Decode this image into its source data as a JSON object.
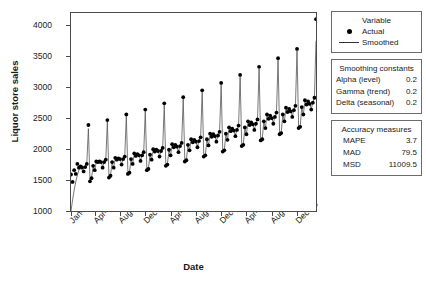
{
  "chart_data": {
    "type": "line",
    "title": "",
    "xlabel": "Date",
    "ylabel": "Liquor store sales",
    "ylim": [
      1000,
      4200
    ],
    "yticks": [
      1000,
      1500,
      2000,
      2500,
      3000,
      3500,
      4000
    ],
    "grid": false,
    "x_tick_labels": [
      "Jan-92",
      "Apr-93",
      "Aug-94",
      "Dec-95",
      "Apr-97",
      "Aug-98",
      "Dec-99",
      "Apr-01",
      "Aug-02",
      "Dec-03"
    ],
    "x_tick_indices": [
      0,
      15,
      31,
      47,
      63,
      79,
      95,
      111,
      127,
      143
    ],
    "x_start": "Jan-92",
    "x_end": "Dec-04",
    "n_points": 156,
    "legend_position": "right",
    "series": [
      {
        "name": "Actual",
        "style": "points",
        "marker": "filled-circle",
        "color": "#000000",
        "values": [
          1590,
          1470,
          1660,
          1600,
          1760,
          1700,
          1720,
          1700,
          1640,
          1710,
          1760,
          2390,
          1480,
          1530,
          1730,
          1660,
          1800,
          1790,
          1800,
          1790,
          1700,
          1790,
          1830,
          2470,
          1540,
          1570,
          1790,
          1700,
          1860,
          1830,
          1850,
          1840,
          1750,
          1840,
          1880,
          2560,
          1600,
          1620,
          1840,
          1760,
          1930,
          1890,
          1920,
          1900,
          1810,
          1900,
          1950,
          2640,
          1660,
          1680,
          1910,
          1830,
          2000,
          1960,
          1990,
          1970,
          1880,
          1970,
          2020,
          2740,
          1730,
          1750,
          1990,
          1900,
          2080,
          2030,
          2070,
          2040,
          1950,
          2050,
          2100,
          2840,
          1800,
          1820,
          2070,
          1980,
          2160,
          2110,
          2150,
          2120,
          2030,
          2130,
          2190,
          2950,
          1880,
          1900,
          2160,
          2060,
          2250,
          2200,
          2240,
          2210,
          2120,
          2220,
          2280,
          3070,
          1960,
          1980,
          2250,
          2150,
          2350,
          2290,
          2330,
          2300,
          2210,
          2310,
          2380,
          3200,
          2050,
          2070,
          2350,
          2240,
          2450,
          2390,
          2430,
          2400,
          2310,
          2410,
          2480,
          3330,
          2140,
          2160,
          2450,
          2340,
          2560,
          2490,
          2540,
          2500,
          2410,
          2520,
          2590,
          3470,
          2240,
          2260,
          2560,
          2450,
          2670,
          2600,
          2650,
          2610,
          2520,
          2630,
          2700,
          3620,
          2340,
          2360,
          2680,
          2560,
          2790,
          2720,
          2770,
          2730,
          2640,
          2750,
          2830,
          4100
        ]
      },
      {
        "name": "Smoothed",
        "style": "line",
        "color": "#555555",
        "values": [
          1000,
          1180,
          1340,
          1470,
          1580,
          1660,
          1720,
          1740,
          1700,
          1730,
          1770,
          2330,
          1500,
          1540,
          1720,
          1660,
          1790,
          1780,
          1800,
          1790,
          1710,
          1790,
          1830,
          2440,
          1550,
          1580,
          1780,
          1700,
          1850,
          1830,
          1850,
          1840,
          1760,
          1840,
          1880,
          2530,
          1610,
          1630,
          1830,
          1760,
          1920,
          1890,
          1910,
          1900,
          1820,
          1900,
          1950,
          2610,
          1670,
          1690,
          1900,
          1830,
          1990,
          1960,
          1980,
          1970,
          1890,
          1970,
          2020,
          2710,
          1740,
          1760,
          1980,
          1900,
          2070,
          2030,
          2060,
          2040,
          1960,
          2050,
          2100,
          2810,
          1810,
          1830,
          2060,
          1980,
          2150,
          2110,
          2140,
          2120,
          2040,
          2130,
          2190,
          2920,
          1890,
          1910,
          2150,
          2060,
          2240,
          2200,
          2230,
          2210,
          2130,
          2220,
          2280,
          3040,
          1970,
          1990,
          2240,
          2150,
          2340,
          2290,
          2320,
          2300,
          2220,
          2310,
          2380,
          3170,
          2060,
          2080,
          2340,
          2240,
          2440,
          2390,
          2420,
          2400,
          2320,
          2410,
          2480,
          3300,
          2150,
          2170,
          2440,
          2340,
          2550,
          2490,
          2530,
          2500,
          2420,
          2520,
          2590,
          3440,
          2250,
          2270,
          2550,
          2450,
          2660,
          2600,
          2640,
          2610,
          2530,
          2630,
          2700,
          3590,
          2350,
          2370,
          2670,
          2560,
          2780,
          2720,
          2760,
          2730,
          2650,
          2750,
          2830,
          3750
        ]
      }
    ]
  },
  "legend": {
    "title": "Variable",
    "items": [
      {
        "label": "Actual",
        "marker": "filled-circle"
      },
      {
        "label": "Smoothed",
        "marker": "line"
      }
    ]
  },
  "smoothing_constants": {
    "title": "Smoothing constants",
    "rows": [
      {
        "name": "Alpha (level)",
        "value": "0.2"
      },
      {
        "name": "Gamma (trend)",
        "value": "0.2"
      },
      {
        "name": "Delta (seasonal)",
        "value": "0.2"
      }
    ]
  },
  "accuracy_measures": {
    "title": "Accuracy measures",
    "rows": [
      {
        "name": "MAPE",
        "value": "3.7"
      },
      {
        "name": "MAD",
        "value": "79.5"
      },
      {
        "name": "MSD",
        "value": "11009.5"
      }
    ]
  },
  "colors": {
    "actual": "#000000",
    "smoothed": "#555555",
    "axis": "#4a4a4a",
    "panel_border": "#6b6b6b"
  }
}
